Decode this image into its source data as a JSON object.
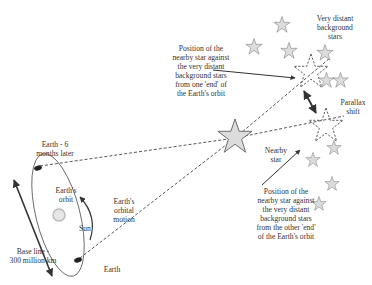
{
  "diagram": {
    "labels": {
      "earth_later": "Earth - 6\nmonths later",
      "earths_orbit": "Earth's\norbit",
      "sun": "Sun",
      "orbital_motion": "Earth's\norbital\nmotion",
      "baseline": "Base line -\n300 million km",
      "earth": "Earth",
      "position_one": "Position of the\nnearby star against\nthe very distant\nbackground stars\nfrom one 'end' of\nthe Earth's orbit",
      "distant_stars": "Very distant\nbackground\nstars",
      "parallax_shift": "Parallax\nshift",
      "nearby_star": "Nearby\nstar",
      "position_other": "Position of the\nnearby star against\nthe very distant\nbackground stars\nfrom the other 'end'\nof the Earth's orbit"
    },
    "colors": {
      "line": "#333333",
      "star_fill": "#d9d9d9",
      "star_stroke": "#777777",
      "sun_fill": "#e0e0e0"
    }
  }
}
